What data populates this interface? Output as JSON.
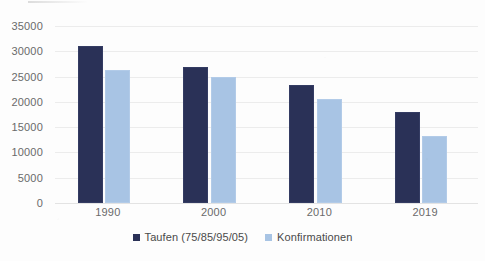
{
  "chart_data": {
    "type": "bar",
    "title": "",
    "subtitle": "",
    "xlabel": "",
    "ylabel": "",
    "categories": [
      "1990",
      "2000",
      "2010",
      "2019"
    ],
    "series": [
      {
        "name": "Taufen (75/85/95/05)",
        "color": "#2a3157",
        "values": [
          31000,
          26800,
          23400,
          17900
        ]
      },
      {
        "name": "Konfirmationen",
        "color": "#a8c4e4",
        "values": [
          26300,
          24900,
          20500,
          13200
        ]
      }
    ],
    "ylim": [
      0,
      35000
    ],
    "ytick_step": 5000,
    "yticks": [
      "0",
      "5000",
      "10000",
      "15000",
      "20000",
      "25000",
      "30000",
      "35000"
    ],
    "grid": true,
    "legend_position": "bottom-center",
    "gridline_color": "#ececec",
    "axis_text_color": "#6a6a6a"
  }
}
